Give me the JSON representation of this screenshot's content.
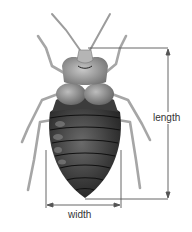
{
  "diagram": {
    "labels": {
      "length": "length",
      "width": "width"
    },
    "colors": {
      "background": "#ffffff",
      "line": "#444444",
      "body_dark": "#2a2a2a",
      "body_mid": "#5a5a5a",
      "body_light": "#9a9a9a",
      "head_light": "#b8b8b8",
      "legs": "#a8a8a8"
    }
  }
}
